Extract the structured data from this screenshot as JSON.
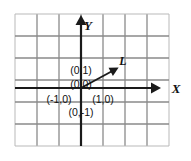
{
  "figure": {
    "background_color": "#ffffff",
    "grid_color": "#8a8a8a",
    "grid_color_light": "#b9b9b9",
    "axis_color": "#1a1a1a",
    "ray_color": "#1a1a1a",
    "label_color": "#111111"
  },
  "grid": {
    "x_left": 15,
    "x_right": 169,
    "y_top": 14,
    "y_bottom": 146,
    "cell_size": 22,
    "columns": 7,
    "rows": 6,
    "vertical_lines": [
      15,
      37,
      59,
      81,
      103,
      125,
      147,
      169
    ],
    "horizontal_lines": [
      14,
      36,
      58,
      80,
      102,
      124,
      146
    ]
  },
  "axes": {
    "origin_x": 81,
    "origin_y": 88,
    "x_axis": {
      "label": "X",
      "label_x": 176,
      "label_y": 90,
      "start_x": 15,
      "end_x": 152,
      "y": 88,
      "arrow": "right"
    },
    "y_axis": {
      "label": "Y",
      "label_x": 88,
      "label_y": 27,
      "x": 81,
      "start_y": 146,
      "end_y": 24,
      "arrow": "up"
    }
  },
  "ray": {
    "name": "L",
    "label": "L",
    "label_x": 123,
    "label_y": 62,
    "start_x": 81,
    "start_y": 88,
    "end_x": 116,
    "end_y": 69,
    "arrow": "end"
  },
  "point_labels": [
    {
      "text": "(0,1)",
      "x": 81,
      "y": 71,
      "anchor": "middle",
      "name": "point-label-0-1"
    },
    {
      "text": "(0,0)",
      "x": 81,
      "y": 85,
      "anchor": "middle",
      "name": "point-label-0-0"
    },
    {
      "text": "(-1,0)",
      "x": 59,
      "y": 100,
      "anchor": "middle",
      "name": "point-label-neg1-0"
    },
    {
      "text": "(1,0)",
      "x": 103,
      "y": 100,
      "anchor": "middle",
      "name": "point-label-1-0"
    },
    {
      "text": "(0,-1)",
      "x": 81,
      "y": 113,
      "anchor": "middle",
      "name": "point-label-0-neg1"
    }
  ],
  "chart_data": {
    "type": "scatter",
    "xlabel": "X",
    "ylabel": "Y",
    "xlim": [
      -3,
      4
    ],
    "ylim": [
      -3,
      3
    ],
    "grid": true,
    "legend": "none",
    "annotations": [
      {
        "label": "(0,1)",
        "x": 0,
        "y": 1
      },
      {
        "label": "(0,0)",
        "x": 0,
        "y": 0
      },
      {
        "label": "(-1,0)",
        "x": -1,
        "y": 0
      },
      {
        "label": "(1,0)",
        "x": 1,
        "y": 0
      },
      {
        "label": "(0,-1)",
        "x": 0,
        "y": -1
      },
      {
        "label": "L",
        "x": 1.9,
        "y": 1.2
      }
    ],
    "series": [
      {
        "name": "L",
        "type": "ray",
        "points": [
          {
            "x": 0,
            "y": 0
          },
          {
            "x": 1.6,
            "y": 0.86
          }
        ]
      }
    ]
  }
}
